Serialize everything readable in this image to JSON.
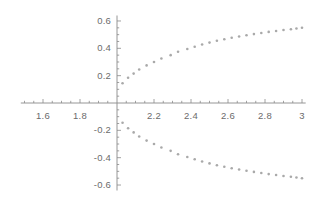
{
  "chart_data": {
    "type": "scatter",
    "title": "",
    "xlabel": "",
    "ylabel": "",
    "xlim": [
      1.48,
      3.02
    ],
    "ylim": [
      -0.64,
      0.64
    ],
    "grid": false,
    "legend": null,
    "x_ticks": [
      1.6,
      1.8,
      2.0,
      2.2,
      2.4,
      2.6,
      2.8,
      3.0
    ],
    "x_tick_labels": [
      "1.6",
      "1.8",
      "",
      "2.2",
      "2.4",
      "2.6",
      "2.8",
      "3"
    ],
    "y_ticks": [
      -0.6,
      -0.4,
      -0.2,
      0.2,
      0.4,
      0.6
    ],
    "y_tick_labels": [
      "-0.6",
      "-0.4",
      "-0.2",
      "0.2",
      "0.4",
      "0.6"
    ],
    "x_minor_step": 0.05,
    "y_minor_step": 0.05,
    "axes_origin": [
      2.0,
      0.0
    ],
    "marker": "point",
    "marker_color": "#9a9a9a",
    "marker_size": 1.3,
    "axis_color": "#8a8a8a",
    "series": [
      {
        "name": "upper-branch",
        "x": [
          2.03,
          2.06,
          2.09,
          2.12,
          2.16,
          2.2,
          2.24,
          2.29,
          2.33,
          2.38,
          2.42,
          2.46,
          2.5,
          2.54,
          2.58,
          2.62,
          2.66,
          2.7,
          2.74,
          2.78,
          2.82,
          2.86,
          2.9,
          2.94,
          2.97,
          3.0
        ],
        "y": [
          0.145,
          0.185,
          0.215,
          0.245,
          0.275,
          0.3,
          0.325,
          0.35,
          0.375,
          0.395,
          0.412,
          0.428,
          0.442,
          0.455,
          0.466,
          0.477,
          0.487,
          0.496,
          0.504,
          0.512,
          0.52,
          0.527,
          0.534,
          0.54,
          0.545,
          0.55
        ]
      },
      {
        "name": "lower-branch",
        "x": [
          2.03,
          2.06,
          2.09,
          2.12,
          2.16,
          2.2,
          2.24,
          2.29,
          2.33,
          2.38,
          2.42,
          2.46,
          2.5,
          2.54,
          2.58,
          2.62,
          2.66,
          2.7,
          2.74,
          2.78,
          2.82,
          2.86,
          2.9,
          2.94,
          2.97,
          3.0
        ],
        "y": [
          -0.145,
          -0.185,
          -0.215,
          -0.245,
          -0.275,
          -0.3,
          -0.325,
          -0.35,
          -0.375,
          -0.395,
          -0.412,
          -0.428,
          -0.442,
          -0.455,
          -0.466,
          -0.477,
          -0.487,
          -0.496,
          -0.504,
          -0.512,
          -0.52,
          -0.527,
          -0.534,
          -0.54,
          -0.545,
          -0.55
        ]
      }
    ]
  },
  "axis_labels": {
    "x": [
      "1.6",
      "1.8",
      "2.2",
      "2.4",
      "2.6",
      "2.8",
      "3"
    ],
    "y": [
      "0.6",
      "0.4",
      "0.2",
      "-0.2",
      "-0.4",
      "-0.6"
    ]
  }
}
